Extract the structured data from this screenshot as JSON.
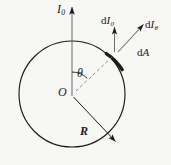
{
  "figure": {
    "background_color": "#f7f7f5",
    "stroke_color": "#1a1a1a",
    "labels": {
      "incident_intensity": {
        "base": "I",
        "sub": "0"
      },
      "differential_intensity_normal": {
        "d": "d",
        "base": "I",
        "sub": "0"
      },
      "differential_intensity_theta": {
        "d": "d",
        "base": "I",
        "sub": "θ"
      },
      "area_element": {
        "d": "d",
        "base": "A"
      },
      "angle": "θ",
      "center": "O",
      "radius": "R"
    },
    "geometry": {
      "circle_center_x": 72,
      "circle_center_y": 94,
      "circle_radius": 53,
      "angle_theta_degrees": 42
    }
  }
}
